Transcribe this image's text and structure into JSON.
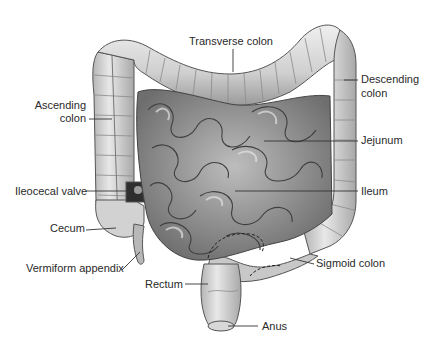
{
  "figure": {
    "colors": {
      "background": "#ffffff",
      "tissue_light": "#e6e6e6",
      "tissue_mid": "#c4c4c4",
      "tissue_dark": "#8c8c8c",
      "outline": "#4a4a4a",
      "leader_line": "#333333",
      "label_text": "#2a2a2a"
    }
  },
  "labels": {
    "transverse_colon": "Transverse colon",
    "ascending_colon_line1": "Ascending",
    "ascending_colon_line2": "colon",
    "descending_colon_line1": "Descending",
    "descending_colon_line2": "colon",
    "jejunum": "Jejunum",
    "ileocecal_valve": "Ileocecal valve",
    "ileum": "Ileum",
    "cecum": "Cecum",
    "sigmoid_colon": "Sigmoid colon",
    "vermiform_appendix": "Vermiform appendix",
    "rectum": "Rectum",
    "anus": "Anus"
  }
}
